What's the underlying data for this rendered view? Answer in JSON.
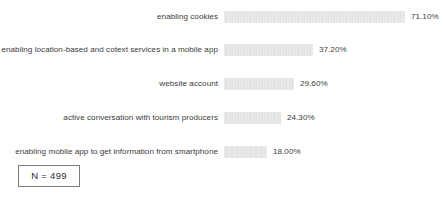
{
  "header": {
    "clipped_fragment": ""
  },
  "annotation": {
    "sample_size_label": "N = 499"
  },
  "chart_data": {
    "type": "bar",
    "orientation": "horizontal",
    "title": "",
    "subtitle": "",
    "xlabel": "",
    "ylabel": "",
    "grid": false,
    "legend": "none",
    "xlim": [
      0,
      100
    ],
    "value_suffix": "%",
    "categories": [
      "enabling cookies",
      "enabling location-based and cotext services in a mobile app",
      "website account",
      "active conversation with tourism producers",
      "enabling mobile app to get information from smartphone"
    ],
    "values": [
      71.1,
      37.2,
      29.6,
      24.3,
      18.0
    ],
    "value_labels": [
      "71.10%",
      "37.20%",
      "29.60%",
      "24.30%",
      "18.00%"
    ],
    "bars": [
      {
        "label": "enabling cookies",
        "value": 71.1,
        "value_label": "71.10%",
        "bar_px": 181
      },
      {
        "label": "enabling location-based and cotext services in a mobile app",
        "value": 37.2,
        "value_label": "37.20%",
        "bar_px": 89
      },
      {
        "label": "website account",
        "value": 29.6,
        "value_label": "29.60%",
        "bar_px": 70
      },
      {
        "label": "active conversation with tourism producers",
        "value": 24.3,
        "value_label": "24.30%",
        "bar_px": 57
      },
      {
        "label": "enabling mobile app to get information from smartphone",
        "value": 18.0,
        "value_label": "18.00%",
        "bar_px": 43
      }
    ],
    "colors": {
      "bar_fill": "#d9d9d9",
      "text": "#3b3b3b",
      "background": "#ffffff",
      "annotation_border": "#7b7b7b"
    }
  }
}
